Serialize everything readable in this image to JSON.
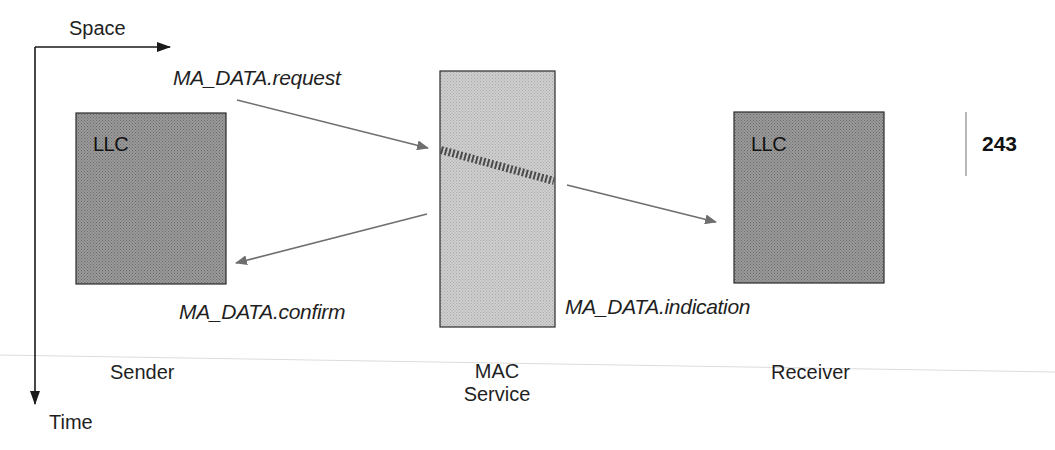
{
  "axes": {
    "horizontal_label": "Space",
    "vertical_label": "Time"
  },
  "entities": {
    "sender": {
      "box_label": "LLC",
      "caption": "Sender"
    },
    "mac": {
      "caption_line1": "MAC",
      "caption_line2": "Service"
    },
    "receiver": {
      "box_label": "LLC",
      "caption": "Receiver"
    }
  },
  "primitives": {
    "request": "MA_DATA.request",
    "confirm": "MA_DATA.confirm",
    "indication": "MA_DATA.indication"
  },
  "page": {
    "number": "243"
  },
  "colors": {
    "llc_fill": "#8a8a8a",
    "mac_fill": "#c4c4c4",
    "arrow": "#6e6e6e",
    "axis": "#222222",
    "rule": "#d8d8d8"
  }
}
